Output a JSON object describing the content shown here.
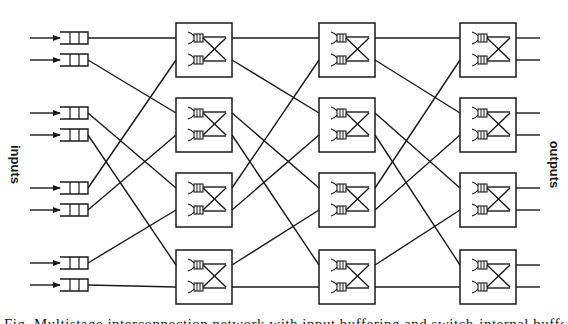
{
  "labels": {
    "inputs": "inputs",
    "outputs": "outputs"
  },
  "caption": "Fig. Multistage interconnection network with input buffering and switch-internal buffers",
  "colors": {
    "ink": "#1a1a1a",
    "background": "#ffffff"
  },
  "network": {
    "num_inputs": 8,
    "num_stages": 3,
    "switches_per_stage": 4,
    "input_rows_y": [
      38,
      60,
      113,
      135,
      188,
      210,
      263,
      285
    ],
    "stage_x": [
      176,
      319,
      460
    ],
    "switch_width": 56,
    "switch_top_y": [
      23,
      98,
      173,
      250
    ],
    "switch_height": 54,
    "port_offsets": [
      15,
      37
    ],
    "interstage_wiring": "perfect-shuffle",
    "input_queue_icon": "fifo-buffer-icon",
    "switch_icon": "2x2-crossbar-switch-icon"
  }
}
